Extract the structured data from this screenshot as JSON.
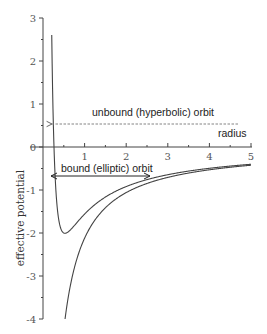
{
  "chart_data": {
    "type": "line",
    "title": "",
    "xlabel": "radius",
    "ylabel": "effective potential",
    "xlim": [
      0,
      5
    ],
    "ylim": [
      -4,
      3
    ],
    "x_ticks": [
      "1",
      "2",
      "3",
      "4",
      "5"
    ],
    "y_ticks": [
      "3",
      "2",
      "1",
      "0",
      "-1",
      "-2",
      "-3",
      "-4"
    ],
    "grid": false,
    "legend": null,
    "series": [
      {
        "name": "effective potential",
        "formula": "0.56/r^2 - 2.12/r",
        "x": [
          0.13,
          0.15,
          0.2,
          0.25,
          0.3,
          0.4,
          0.53,
          0.7,
          1.0,
          1.5,
          2.0,
          2.5,
          3.0,
          3.5,
          4.0,
          4.5,
          5.0
        ],
        "values": [
          16.8,
          10.8,
          3.4,
          0.48,
          -0.85,
          -1.8,
          -2.0,
          -1.9,
          -1.56,
          -1.17,
          -0.92,
          -0.76,
          -0.64,
          -0.56,
          -0.5,
          -0.44,
          -0.4
        ]
      },
      {
        "name": "gravitational potential",
        "formula": "-2.12/r",
        "x": [
          0.53,
          0.6,
          0.7,
          0.8,
          1.0,
          1.25,
          1.5,
          2.0,
          2.5,
          3.0,
          3.5,
          4.0,
          4.5,
          5.0
        ],
        "values": [
          -4.0,
          -3.53,
          -3.03,
          -2.65,
          -2.12,
          -1.7,
          -1.41,
          -1.06,
          -0.85,
          -0.71,
          -0.61,
          -0.53,
          -0.47,
          -0.42
        ]
      }
    ],
    "annotations": [
      {
        "text": "unbound (hyperbolic) orbit",
        "style": "dashed arrow",
        "y": 1.2,
        "x_from": 4.85,
        "x_to": 0.18
      },
      {
        "text": "bound (elliptic) orbit",
        "style": "double arrow",
        "y": -0.7,
        "x_from": 0.18,
        "x_to": 2.55
      },
      {
        "text": "radius",
        "x": 4.6,
        "y": 0.3
      }
    ]
  }
}
